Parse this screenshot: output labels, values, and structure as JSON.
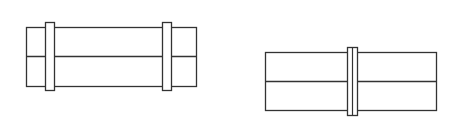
{
  "canvas": {
    "width": 456,
    "height": 124,
    "background": "#ffffff",
    "stroke": "#333333"
  },
  "figures": [
    {
      "name": "pipe-with-two-clamps",
      "body": {
        "x": 26,
        "y": 27,
        "w": 170,
        "h": 59
      },
      "midline_y": 56,
      "bands": [
        {
          "x": 45,
          "y": 22,
          "w": 9,
          "h": 68
        },
        {
          "x": 162,
          "y": 22,
          "w": 9,
          "h": 68
        }
      ]
    },
    {
      "name": "pipe-with-center-coupling",
      "body": {
        "x": 265,
        "y": 52,
        "w": 171,
        "h": 58
      },
      "midline_y": 81,
      "bands": [
        {
          "x": 347,
          "y": 47,
          "w": 10,
          "h": 68,
          "inner_line_x": 352
        }
      ]
    }
  ]
}
